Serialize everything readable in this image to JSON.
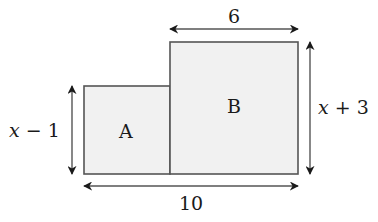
{
  "diagram": {
    "type": "composite-rectangle-dimensions",
    "colors": {
      "fill": "#f1f1f1",
      "stroke": "#555555",
      "arrow": "#1a1a1a",
      "text": "#1a1a1a"
    },
    "rectangles": [
      {
        "id": "A",
        "label": "A"
      },
      {
        "id": "B",
        "label": "B"
      }
    ],
    "dimensions": {
      "top_width": "6",
      "bottom_width": "10",
      "left_height_var": "x",
      "left_height_rest": " − 1",
      "right_height_var": "x",
      "right_height_rest": " + 3"
    }
  }
}
